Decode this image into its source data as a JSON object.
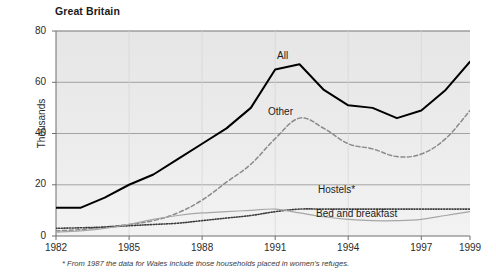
{
  "header": {
    "title": "Great Britain"
  },
  "footnote": {
    "text": "* From 1987 the data for Wales include those households placed in women's refuges."
  },
  "labels": {
    "all": "All",
    "other": "Other",
    "hostels": "Hostels*",
    "bed_and_breakfast": "Bed and breakfast"
  },
  "axes": {
    "y_title": "Thousands",
    "y_ticks": [
      "0",
      "20",
      "40",
      "60",
      "80"
    ],
    "x_ticks": [
      "1982",
      "1985",
      "1988",
      "1991",
      "1994",
      "1997",
      "1999"
    ]
  },
  "colors": {
    "all_line": "#000000",
    "other_line": "#8a8a8a",
    "hostels_line": "#3c3c3c",
    "bed_breakfast_line": "#a6a6a6",
    "plot_background": "#e9e9e9",
    "gridline": "#8f8f8f",
    "axis": "#6e6e6e",
    "text": "#1b1b1b"
  },
  "chart_data": {
    "type": "line",
    "title": "Great Britain",
    "subtitle": "",
    "xlabel": "",
    "ylabel": "Thousands",
    "xlim": [
      1982,
      1999
    ],
    "ylim": [
      0,
      80
    ],
    "grid": true,
    "legend_position": "inline-annotations",
    "x": [
      1982,
      1983,
      1984,
      1985,
      1986,
      1987,
      1988,
      1989,
      1990,
      1991,
      1992,
      1993,
      1994,
      1995,
      1996,
      1997,
      1998,
      1999
    ],
    "x_tick_values": [
      1982,
      1985,
      1988,
      1991,
      1994,
      1997,
      1999
    ],
    "y_tick_values": [
      0,
      20,
      40,
      60,
      80
    ],
    "series": [
      {
        "name": "All",
        "style": "solid",
        "color": "#000000",
        "values": [
          11,
          11,
          15,
          20,
          24,
          30,
          36,
          42,
          50,
          65,
          67,
          57,
          51,
          50,
          46,
          49,
          57,
          68
        ]
      },
      {
        "name": "Other",
        "style": "dashed",
        "color": "#8a8a8a",
        "values": [
          2,
          2.5,
          3.5,
          4.5,
          6,
          9,
          14,
          21,
          28,
          38,
          46,
          42,
          36,
          34,
          31,
          32,
          38,
          49
        ]
      },
      {
        "name": "Hostels*",
        "style": "dotted",
        "color": "#3c3c3c",
        "values": [
          3,
          3.2,
          3.5,
          4,
          4.5,
          5,
          6,
          7,
          8,
          9.5,
          10.5,
          10.5,
          10.5,
          10.5,
          10.5,
          10.5,
          10.5,
          10.5
        ]
      },
      {
        "name": "Bed and breakfast",
        "style": "solid-thin",
        "color": "#a6a6a6",
        "values": [
          1.5,
          2,
          3,
          4.5,
          6.5,
          8,
          9,
          9.5,
          10,
          10.5,
          9,
          7.5,
          6.5,
          6,
          6,
          6.5,
          8,
          9.5
        ]
      }
    ]
  }
}
